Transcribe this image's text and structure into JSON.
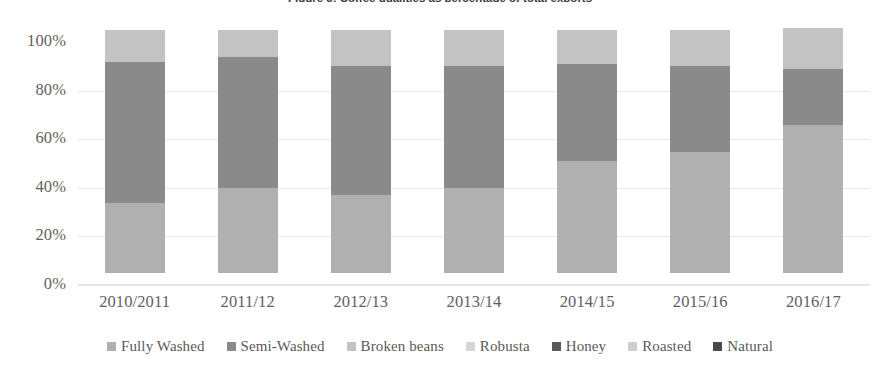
{
  "figure": {
    "title": "Figure 3: Coffee qualities as percentage of total exports"
  },
  "axes": {
    "y_ticks": [
      "100%",
      "80%",
      "60%",
      "40%",
      "20%",
      "0%"
    ],
    "x_ticks": [
      "2010/2011",
      "2011/12",
      "2012/13",
      "2013/14",
      "2014/15",
      "2015/16",
      "2016/17"
    ]
  },
  "legend": {
    "items": [
      {
        "label": "Fully Washed",
        "color": "#b0b0b0"
      },
      {
        "label": "Semi-Washed",
        "color": "#8a8a8a"
      },
      {
        "label": "Broken beans",
        "color": "#c3c3c3"
      },
      {
        "label": "Robusta",
        "color": "#d5d5d5"
      },
      {
        "label": "Honey",
        "color": "#5a5a5a"
      },
      {
        "label": "Roasted",
        "color": "#cfcfcf"
      },
      {
        "label": "Natural",
        "color": "#4a4a4a"
      }
    ]
  },
  "chart_data": {
    "type": "bar",
    "stacked": true,
    "normalized": true,
    "title": "Figure 3: Coffee qualities as percentage of total exports",
    "xlabel": "",
    "ylabel": "",
    "ylim": [
      0,
      100
    ],
    "ytick_step": 20,
    "grid": true,
    "legend_position": "bottom",
    "categories": [
      "2010/2011",
      "2011/12",
      "2012/13",
      "2013/14",
      "2014/15",
      "2015/16",
      "2016/17"
    ],
    "series": [
      {
        "name": "Fully Washed",
        "color": "#b0b0b0",
        "values": [
          29,
          35,
          32,
          35,
          46,
          50,
          61
        ]
      },
      {
        "name": "Semi-Washed",
        "color": "#8a8a8a",
        "values": [
          58,
          54,
          53,
          50,
          40,
          35,
          23
        ]
      },
      {
        "name": "Broken beans",
        "color": "#c3c3c3",
        "values": [
          13,
          11,
          15,
          15,
          14,
          15,
          17
        ]
      },
      {
        "name": "Robusta",
        "color": "#d5d5d5",
        "values": [
          0,
          0,
          0,
          0,
          0,
          0,
          0
        ]
      },
      {
        "name": "Honey",
        "color": "#5a5a5a",
        "values": [
          0,
          0,
          0,
          0,
          0,
          0,
          0
        ]
      },
      {
        "name": "Roasted",
        "color": "#cfcfcf",
        "values": [
          0,
          0,
          0,
          0,
          0,
          0,
          0
        ]
      },
      {
        "name": "Natural",
        "color": "#4a4a4a",
        "values": [
          0,
          0,
          0,
          0,
          0,
          0,
          0
        ]
      }
    ]
  }
}
